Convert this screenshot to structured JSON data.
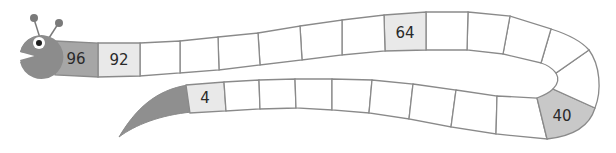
{
  "figure": {
    "colors": {
      "outline": "#8a8a8a",
      "head": "#8c8c8c",
      "dark_cell": "#a6a6a6",
      "light_cell": "#e9e9e9",
      "blank_cell": "#ffffff",
      "marked_cell": "#c8c8c8",
      "tail": "#8f8f8f",
      "text": "#2a2a2a"
    },
    "cells": [
      {
        "label": "96",
        "position": "head"
      },
      {
        "label": "92",
        "position": "top-2"
      },
      {
        "label": "",
        "position": "top-3"
      },
      {
        "label": "",
        "position": "top-4"
      },
      {
        "label": "",
        "position": "top-5"
      },
      {
        "label": "",
        "position": "top-6"
      },
      {
        "label": "",
        "position": "top-7"
      },
      {
        "label": "",
        "position": "top-8"
      },
      {
        "label": "64",
        "position": "top-9"
      },
      {
        "label": "",
        "position": "top-10"
      },
      {
        "label": "",
        "position": "top-11"
      },
      {
        "label": "",
        "position": "top-12"
      },
      {
        "label": "",
        "position": "bend-1"
      },
      {
        "label": "",
        "position": "bend-2"
      },
      {
        "label": "40",
        "position": "bend-3"
      },
      {
        "label": "",
        "position": "bottom-1"
      },
      {
        "label": "",
        "position": "bottom-2"
      },
      {
        "label": "",
        "position": "bottom-3"
      },
      {
        "label": "",
        "position": "bottom-4"
      },
      {
        "label": "",
        "position": "bottom-5"
      },
      {
        "label": "",
        "position": "bottom-6"
      },
      {
        "label": "",
        "position": "bottom-7"
      },
      {
        "label": "",
        "position": "bottom-8"
      },
      {
        "label": "4",
        "position": "bottom-9"
      }
    ],
    "labels": {
      "n96": "96",
      "n92": "92",
      "n64": "64",
      "n40": "40",
      "n4": "4"
    }
  }
}
